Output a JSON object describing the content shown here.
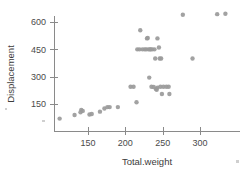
{
  "chart_data": {
    "type": "scatter",
    "title": "",
    "xlabel": "Total.weight",
    "ylabel": "Displacement",
    "xlim": [
      105,
      340
    ],
    "ylim": [
      55,
      660
    ],
    "grid": false,
    "legend": null,
    "xticks": [
      150,
      200,
      250,
      300
    ],
    "yticks": [
      150,
      300,
      450,
      600
    ],
    "marker": {
      "shape": "circle",
      "color": "#9a9a9a",
      "radius_px": 2.2
    },
    "points": [
      {
        "x": 112,
        "y": 70
      },
      {
        "x": 132,
        "y": 90
      },
      {
        "x": 140,
        "y": 105
      },
      {
        "x": 141,
        "y": 118
      },
      {
        "x": 143,
        "y": 112
      },
      {
        "x": 152,
        "y": 92
      },
      {
        "x": 155,
        "y": 95
      },
      {
        "x": 166,
        "y": 108
      },
      {
        "x": 172,
        "y": 125
      },
      {
        "x": 176,
        "y": 133
      },
      {
        "x": 179,
        "y": 133
      },
      {
        "x": 190,
        "y": 133
      },
      {
        "x": 207,
        "y": 245
      },
      {
        "x": 211,
        "y": 245
      },
      {
        "x": 215,
        "y": 160
      },
      {
        "x": 216,
        "y": 450
      },
      {
        "x": 219,
        "y": 450
      },
      {
        "x": 220,
        "y": 555
      },
      {
        "x": 223,
        "y": 450
      },
      {
        "x": 226,
        "y": 450
      },
      {
        "x": 228,
        "y": 450
      },
      {
        "x": 229,
        "y": 510
      },
      {
        "x": 230,
        "y": 512
      },
      {
        "x": 231,
        "y": 450
      },
      {
        "x": 232,
        "y": 295
      },
      {
        "x": 233,
        "y": 450
      },
      {
        "x": 234,
        "y": 450
      },
      {
        "x": 235,
        "y": 245
      },
      {
        "x": 236,
        "y": 450
      },
      {
        "x": 238,
        "y": 243
      },
      {
        "x": 239,
        "y": 450
      },
      {
        "x": 240,
        "y": 400
      },
      {
        "x": 241,
        "y": 232
      },
      {
        "x": 242,
        "y": 228
      },
      {
        "x": 243,
        "y": 510
      },
      {
        "x": 243,
        "y": 240
      },
      {
        "x": 245,
        "y": 460
      },
      {
        "x": 246,
        "y": 400
      },
      {
        "x": 247,
        "y": 245
      },
      {
        "x": 248,
        "y": 400
      },
      {
        "x": 249,
        "y": 205
      },
      {
        "x": 251,
        "y": 245
      },
      {
        "x": 255,
        "y": 245
      },
      {
        "x": 258,
        "y": 245
      },
      {
        "x": 259,
        "y": 205
      },
      {
        "x": 277,
        "y": 640
      },
      {
        "x": 290,
        "y": 400
      },
      {
        "x": 323,
        "y": 643
      },
      {
        "x": 334,
        "y": 645
      }
    ]
  },
  "axes": {
    "y_axis_name": "y-axis",
    "x_axis_name": "x-axis"
  }
}
